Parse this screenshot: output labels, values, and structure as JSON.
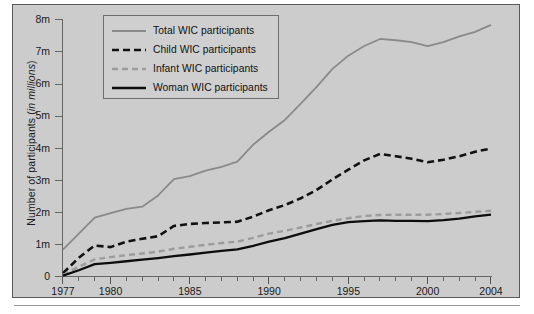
{
  "figure": {
    "background_color": "#cccccc",
    "border_color": "#5a5a5a"
  },
  "axes": {
    "y_title_prefix": "Number of participants (",
    "y_title_italic": "in millions",
    "y_title_suffix": ")",
    "y_ticks": [
      "8m",
      "7m",
      "6m",
      "5m",
      "4m",
      "3m",
      "2m",
      "1m",
      "0"
    ],
    "y_tick_values": [
      8,
      7,
      6,
      5,
      4,
      3,
      2,
      1,
      0
    ],
    "x_major_labels": [
      "1977",
      "1980",
      "1985",
      "1990",
      "1995",
      "2000",
      "2004"
    ],
    "x_major_values": [
      1977,
      1980,
      1985,
      1990,
      1995,
      2000,
      2004
    ]
  },
  "legend": {
    "position": "top-left-inside",
    "items": [
      {
        "label": "Total WIC participants",
        "color": "#8a8a8a",
        "style": "solid",
        "width": 1.8,
        "series": "total"
      },
      {
        "label": "Child WIC participants",
        "color": "#111111",
        "style": "dashed",
        "width": 2.6,
        "series": "child"
      },
      {
        "label": "Infant WIC participants",
        "color": "#9c9c9c",
        "style": "dashed",
        "width": 2.4,
        "series": "infant"
      },
      {
        "label": "Woman WIC participants",
        "color": "#0d0d0d",
        "style": "solid",
        "width": 2.3,
        "series": "woman"
      }
    ]
  },
  "chart_data": {
    "type": "line",
    "title": "",
    "xlabel": "",
    "ylabel": "Number of participants (in millions)",
    "xlim": [
      1977,
      2004
    ],
    "ylim": [
      0,
      8
    ],
    "grid": false,
    "legend_position": "upper left (inside plot)",
    "x": [
      1977,
      1978,
      1979,
      1980,
      1981,
      1982,
      1983,
      1984,
      1985,
      1986,
      1987,
      1988,
      1989,
      1990,
      1991,
      1992,
      1993,
      1994,
      1995,
      1996,
      1997,
      1998,
      1999,
      2000,
      2001,
      2002,
      2003,
      2004
    ],
    "series": [
      {
        "name": "Total WIC participants",
        "color": "#8a8a8a",
        "style": "solid",
        "values": [
          0.85,
          1.35,
          1.85,
          1.99,
          2.12,
          2.19,
          2.54,
          3.05,
          3.14,
          3.31,
          3.43,
          3.59,
          4.12,
          4.52,
          4.89,
          5.4,
          5.92,
          6.48,
          6.89,
          7.19,
          7.41,
          7.37,
          7.31,
          7.19,
          7.31,
          7.49,
          7.63,
          7.85
        ]
      },
      {
        "name": "Child WIC participants",
        "color": "#111111",
        "style": "dashed",
        "values": [
          0.12,
          0.6,
          0.98,
          0.93,
          1.1,
          1.19,
          1.27,
          1.59,
          1.65,
          1.68,
          1.7,
          1.72,
          1.88,
          2.08,
          2.24,
          2.45,
          2.71,
          3.04,
          3.34,
          3.63,
          3.83,
          3.76,
          3.68,
          3.57,
          3.65,
          3.76,
          3.9,
          4.0
        ]
      },
      {
        "name": "Infant WIC participants",
        "color": "#9c9c9c",
        "style": "dashed",
        "values": [
          0.06,
          0.32,
          0.55,
          0.62,
          0.68,
          0.73,
          0.79,
          0.88,
          0.94,
          1.0,
          1.06,
          1.1,
          1.22,
          1.35,
          1.44,
          1.54,
          1.65,
          1.75,
          1.83,
          1.9,
          1.93,
          1.94,
          1.94,
          1.94,
          1.96,
          1.99,
          2.03,
          2.06
        ]
      },
      {
        "name": "Woman WIC participants",
        "color": "#0d0d0d",
        "style": "solid",
        "values": [
          0.04,
          0.21,
          0.4,
          0.44,
          0.49,
          0.54,
          0.59,
          0.65,
          0.7,
          0.76,
          0.81,
          0.86,
          0.97,
          1.1,
          1.21,
          1.35,
          1.49,
          1.62,
          1.71,
          1.74,
          1.76,
          1.75,
          1.75,
          1.74,
          1.77,
          1.82,
          1.89,
          1.94
        ]
      }
    ]
  }
}
